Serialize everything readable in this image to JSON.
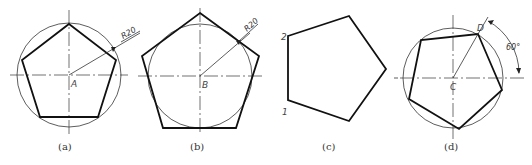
{
  "figures": [
    {
      "id": "a",
      "caption": "(a)",
      "center_label": "A",
      "dimension_label": "R20",
      "description": "Regular pentagon inscribed in a circle"
    },
    {
      "id": "b",
      "caption": "(b)",
      "center_label": "B",
      "dimension_label": "R20",
      "description": "Regular pentagon circumscribed about a circle"
    },
    {
      "id": "c",
      "caption": "(c)",
      "vertex_labels": [
        "2",
        "1"
      ],
      "description": "Regular pentagon with labeled vertices"
    },
    {
      "id": "d",
      "caption": "(d)",
      "center_label": "C",
      "vertex_label": "D",
      "angle_label": "60°",
      "description": "Regular pentagon inscribed in a circle, rotated, with angle dimension"
    }
  ]
}
